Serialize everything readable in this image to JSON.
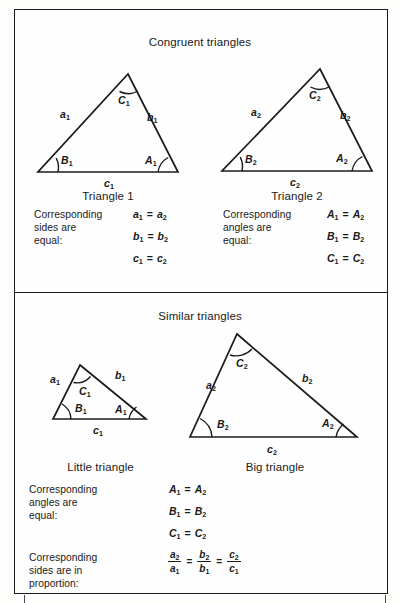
{
  "figure": {
    "background_color": "#fefefe",
    "line_color": "#1b1b1b"
  },
  "panels": [
    {
      "id": "congruent",
      "title": "Congruent triangles",
      "figures": [
        {
          "id": "triangle-1",
          "caption": "Triangle 1",
          "side_labels": [
            "a",
            "b",
            "c"
          ],
          "angle_labels": [
            "A",
            "B",
            "C"
          ],
          "subscript": "1",
          "labels": {
            "side_a": "a",
            "side_a_sub": "1",
            "side_b": "b",
            "side_b_sub": "1",
            "side_c": "c",
            "side_c_sub": "1",
            "angle_A": "A",
            "angle_A_sub": "1",
            "angle_B": "B",
            "angle_B_sub": "1",
            "angle_C": "C",
            "angle_C_sub": "1"
          }
        },
        {
          "id": "triangle-2",
          "caption": "Triangle 2",
          "side_labels": [
            "a",
            "b",
            "c"
          ],
          "angle_labels": [
            "A",
            "B",
            "C"
          ],
          "subscript": "2",
          "labels": {
            "side_a": "a",
            "side_a_sub": "2",
            "side_b": "b",
            "side_b_sub": "2",
            "side_c": "c",
            "side_c_sub": "2",
            "angle_A": "A",
            "angle_A_sub": "2",
            "angle_B": "B",
            "angle_B_sub": "2",
            "angle_C": "C",
            "angle_C_sub": "2"
          }
        }
      ],
      "statements": [
        {
          "id": "congruent-sides",
          "text": "Corresponding\nsides are\nequal:",
          "equations": [
            {
              "lhs": "a",
              "lhs_sub": "1",
              "op": "=",
              "rhs": "a",
              "rhs_sub": "2"
            },
            {
              "lhs": "b",
              "lhs_sub": "1",
              "op": "=",
              "rhs": "b",
              "rhs_sub": "2"
            },
            {
              "lhs": "c",
              "lhs_sub": "1",
              "op": "=",
              "rhs": "c",
              "rhs_sub": "2"
            }
          ]
        },
        {
          "id": "congruent-angles",
          "text": "Corresponding\nangles are\nequal:",
          "equations": [
            {
              "lhs": "A",
              "lhs_sub": "1",
              "op": "=",
              "rhs": "A",
              "rhs_sub": "2"
            },
            {
              "lhs": "B",
              "lhs_sub": "1",
              "op": "=",
              "rhs": "B",
              "rhs_sub": "2"
            },
            {
              "lhs": "C",
              "lhs_sub": "1",
              "op": "=",
              "rhs": "C",
              "rhs_sub": "2"
            }
          ]
        }
      ]
    },
    {
      "id": "similar",
      "title": "Similar triangles",
      "figures": [
        {
          "id": "little-triangle",
          "caption": "Little triangle",
          "subscript": "1",
          "labels": {
            "side_a": "a",
            "side_a_sub": "1",
            "side_b": "b",
            "side_b_sub": "1",
            "side_c": "c",
            "side_c_sub": "1",
            "angle_A": "A",
            "angle_A_sub": "1",
            "angle_B": "B",
            "angle_B_sub": "1",
            "angle_C": "C",
            "angle_C_sub": "1"
          }
        },
        {
          "id": "big-triangle",
          "caption": "Big triangle",
          "subscript": "2",
          "labels": {
            "side_a": "a",
            "side_a_sub": "2",
            "side_b": "b",
            "side_b_sub": "2",
            "side_c": "c",
            "side_c_sub": "2",
            "angle_A": "A",
            "angle_A_sub": "2",
            "angle_B": "B",
            "angle_B_sub": "2",
            "angle_C": "C",
            "angle_C_sub": "2"
          }
        }
      ],
      "statements": [
        {
          "id": "similar-angles",
          "text": "Corresponding\nangles are\nequal:",
          "equations": [
            {
              "lhs": "A",
              "lhs_sub": "1",
              "op": "=",
              "rhs": "A",
              "rhs_sub": "2"
            },
            {
              "lhs": "B",
              "lhs_sub": "1",
              "op": "=",
              "rhs": "B",
              "rhs_sub": "2"
            },
            {
              "lhs": "C",
              "lhs_sub": "1",
              "op": "=",
              "rhs": "C",
              "rhs_sub": "2"
            }
          ]
        },
        {
          "id": "similar-sides",
          "text": "Corresponding\nsides are in\nproportion:",
          "proportion": {
            "fractions": [
              {
                "num": "a",
                "num_sub": "2",
                "den": "a",
                "den_sub": "1"
              },
              {
                "num": "b",
                "num_sub": "2",
                "den": "b",
                "den_sub": "1"
              },
              {
                "num": "c",
                "num_sub": "2",
                "den": "c",
                "den_sub": "1"
              }
            ],
            "op": "="
          }
        }
      ]
    }
  ]
}
